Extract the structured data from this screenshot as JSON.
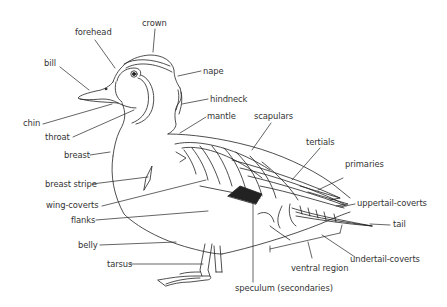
{
  "diagram": {
    "line_color": "#222222",
    "text_color": "#333333",
    "labels": {
      "crown": "crown",
      "forehead": "forehead",
      "bill": "bill",
      "nape": "nape",
      "hindneck": "hindneck",
      "mantle": "mantle",
      "scapulars": "scapulars",
      "chin": "chin",
      "throat": "throat",
      "tertials": "tertials",
      "primaries": "primaries",
      "breast": "breast",
      "breast_stripe": "breast stripe",
      "uppertail_coverts": "uppertail-coverts",
      "wing_coverts": "wing-coverts",
      "flanks": "flanks",
      "tail": "tail",
      "belly": "belly",
      "undertail_coverts": "undertail-coverts",
      "ventral_region": "ventral region",
      "tarsus": "tarsus",
      "speculum": "speculum (secondaries)"
    }
  }
}
